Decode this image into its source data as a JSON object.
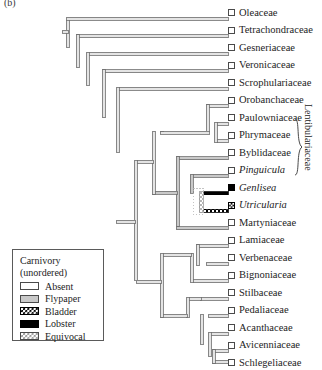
{
  "figure": {
    "panel_label": "(b)",
    "clade_bracket_label": "Lentibulariaceae"
  },
  "legend": {
    "title_line1": "Carnivory",
    "title_line2": "(unordered)",
    "items": [
      {
        "label": "Absent",
        "swatch": "absent",
        "color": "#ffffff"
      },
      {
        "label": "Flypaper",
        "swatch": "flypaper",
        "color": "#c9c9c9"
      },
      {
        "label": "Bladder",
        "swatch": "bladder",
        "color": "#000000"
      },
      {
        "label": "Lobster",
        "swatch": "lobster",
        "color": "#000000"
      },
      {
        "label": "Equivocal",
        "swatch": "equivocal",
        "color": "#9a9a9a"
      }
    ]
  },
  "chart_data": {
    "type": "tree",
    "title": "(b)",
    "character": "Carnivory (unordered)",
    "states": [
      "Absent",
      "Flypaper",
      "Bladder",
      "Lobster",
      "Equivocal"
    ],
    "state_colors": {
      "Absent": "#ffffff",
      "Flypaper": "#c9c9c9",
      "Bladder": "#000000",
      "Lobster": "#000000",
      "Equivocal": "#9a9a9a"
    },
    "clade_bracket": {
      "label": "Lentibulariaceae",
      "from_taxon": "Pinguicula",
      "to_taxon": "Utricularia"
    },
    "taxa": [
      {
        "name": "Oleaceae",
        "italic": false,
        "state": "Absent",
        "y": 12.5
      },
      {
        "name": "Tetrachondraceae",
        "italic": false,
        "state": "Absent",
        "y": 30.0
      },
      {
        "name": "Gesneriaceae",
        "italic": false,
        "state": "Absent",
        "y": 47.5
      },
      {
        "name": "Veronicaceae",
        "italic": false,
        "state": "Absent",
        "y": 65.0
      },
      {
        "name": "Scrophulariaceae",
        "italic": false,
        "state": "Absent",
        "y": 82.5
      },
      {
        "name": "Orobanchaceae",
        "italic": false,
        "state": "Absent",
        "y": 100.0
      },
      {
        "name": "Paulowniaceae",
        "italic": false,
        "state": "Absent",
        "y": 117.5
      },
      {
        "name": "Phrymaceae",
        "italic": false,
        "state": "Absent",
        "y": 135.0
      },
      {
        "name": "Byblidaceae",
        "italic": false,
        "state": "Absent",
        "y": 152.5
      },
      {
        "name": "Pinguicula",
        "italic": true,
        "state": "Absent",
        "y": 170.0
      },
      {
        "name": "Genlisea",
        "italic": true,
        "state": "Lobster",
        "y": 187.5
      },
      {
        "name": "Utricularia",
        "italic": true,
        "state": "Bladder",
        "y": 205.0
      },
      {
        "name": "Martyniaceae",
        "italic": false,
        "state": "Absent",
        "y": 222.5
      },
      {
        "name": "Lamiaceae",
        "italic": false,
        "state": "Absent",
        "y": 240.0
      },
      {
        "name": "Verbenaceae",
        "italic": false,
        "state": "Absent",
        "y": 257.5
      },
      {
        "name": "Bignoniaceae",
        "italic": false,
        "state": "Absent",
        "y": 275.0
      },
      {
        "name": "Stilbaceae",
        "italic": false,
        "state": "Absent",
        "y": 292.5
      },
      {
        "name": "Pedaliaceae",
        "italic": false,
        "state": "Absent",
        "y": 310.0
      },
      {
        "name": "Acanthaceae",
        "italic": false,
        "state": "Absent",
        "y": 327.5
      },
      {
        "name": "Avicenniaceae",
        "italic": false,
        "state": "Absent",
        "y": 345.0
      },
      {
        "name": "Schlegeliaceae",
        "italic": false,
        "state": "Absent",
        "y": 362.5
      }
    ]
  }
}
